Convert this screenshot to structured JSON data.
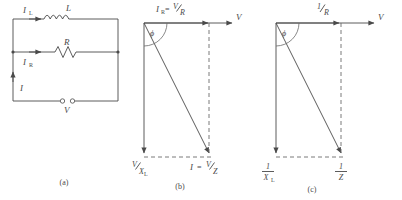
{
  "figure": {
    "caption_a": "(a)",
    "caption_b": "(b)",
    "caption_c": "(c)"
  },
  "circuit": {
    "label_inductor": "L",
    "label_resistor": "R",
    "label_current_l": "I",
    "label_current_l_sub": "L",
    "label_current_r": "I",
    "label_current_r_sub": "R",
    "label_current_total": "I",
    "label_voltage": "V"
  },
  "phasor_b": {
    "axis_label": "V",
    "top_label_main": "I",
    "top_label_sub": "R",
    "top_label_eq": "=",
    "top_frac_num": "V",
    "top_frac_den": "R",
    "angle_label": "ϕ",
    "left_label_main": "I",
    "left_label_eq": "=",
    "left_frac_num": "V",
    "left_frac_den": "X",
    "left_frac_den_sub": "L",
    "right_label_main": "I",
    "right_label_eq": "=",
    "right_frac_num": "V",
    "right_frac_den": "Z"
  },
  "phasor_c": {
    "axis_label": "V",
    "top_frac_num": "1",
    "top_frac_den": "R",
    "angle_label": "ϕ",
    "left_frac_num": "1",
    "left_frac_den": "X",
    "left_frac_den_sub": "L",
    "right_frac_num": "1",
    "right_frac_den": "Z"
  },
  "colors": {
    "ink": "#4a4a4a",
    "dash": "#6b6b6b",
    "background": "#ffffff"
  }
}
